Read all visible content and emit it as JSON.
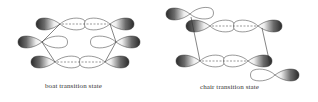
{
  "figure": {
    "panels": [
      {
        "id": "boat",
        "caption": "boat transition state"
      },
      {
        "id": "chair",
        "caption": "chair transition state"
      }
    ]
  },
  "colors": {
    "lobe_dark": "#2a2a2a",
    "lobe_light": "#f4f4f4",
    "outline": "#333333",
    "dashed_bond": "#555555"
  }
}
